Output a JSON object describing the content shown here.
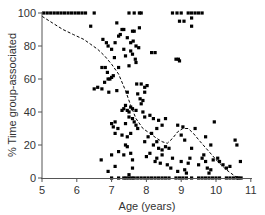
{
  "chart_data": {
    "type": "scatter",
    "title": "",
    "xlabel": "Age (years)",
    "ylabel": "% Time group-associated",
    "xlim": [
      5,
      11
    ],
    "ylim": [
      0,
      100
    ],
    "xticks": [
      5,
      6,
      7,
      8,
      9,
      10,
      11
    ],
    "yticks": [
      0,
      20,
      40,
      60,
      80,
      100
    ],
    "grid": false,
    "legend": null,
    "series": [
      {
        "name": "observations",
        "kind": "points",
        "marker": "square",
        "color": "#000000",
        "points": [
          [
            5.05,
            100
          ],
          [
            5.15,
            100
          ],
          [
            5.25,
            100
          ],
          [
            5.35,
            100
          ],
          [
            5.45,
            100
          ],
          [
            5.55,
            100
          ],
          [
            5.65,
            100
          ],
          [
            5.75,
            100
          ],
          [
            5.85,
            100
          ],
          [
            5.95,
            100
          ],
          [
            6.05,
            100
          ],
          [
            6.15,
            100
          ],
          [
            6.25,
            100
          ],
          [
            6.5,
            100
          ],
          [
            7.5,
            100
          ],
          [
            7.65,
            100
          ],
          [
            7.8,
            100
          ],
          [
            7.85,
            100
          ],
          [
            8.75,
            100
          ],
          [
            8.88,
            100
          ],
          [
            9.0,
            100
          ],
          [
            9.2,
            100
          ],
          [
            9.3,
            100
          ],
          [
            9.4,
            100
          ],
          [
            9.5,
            100
          ],
          [
            9.6,
            100
          ],
          [
            8.95,
            95
          ],
          [
            9.08,
            95
          ],
          [
            9.3,
            97
          ],
          [
            9.3,
            92
          ],
          [
            6.4,
            92
          ],
          [
            7.15,
            94
          ],
          [
            7.3,
            90
          ],
          [
            7.35,
            90
          ],
          [
            7.6,
            89
          ],
          [
            7.8,
            91
          ],
          [
            7.65,
            89
          ],
          [
            6.75,
            84
          ],
          [
            6.85,
            82
          ],
          [
            6.9,
            80
          ],
          [
            7.0,
            78
          ],
          [
            7.1,
            82
          ],
          [
            7.2,
            86
          ],
          [
            7.25,
            87
          ],
          [
            7.45,
            85
          ],
          [
            7.55,
            82
          ],
          [
            7.62,
            83
          ],
          [
            7.7,
            80
          ],
          [
            7.78,
            79
          ],
          [
            7.55,
            77
          ],
          [
            7.35,
            78
          ],
          [
            7.4,
            74
          ],
          [
            7.6,
            75
          ],
          [
            7.68,
            72
          ],
          [
            7.7,
            70
          ],
          [
            7.5,
            68
          ],
          [
            7.2,
            67
          ],
          [
            7.08,
            73
          ],
          [
            8.15,
            76
          ],
          [
            8.25,
            76
          ],
          [
            8.85,
            72
          ],
          [
            8.92,
            72
          ],
          [
            8.95,
            71
          ],
          [
            6.72,
            67
          ],
          [
            6.82,
            67
          ],
          [
            6.88,
            64
          ],
          [
            6.9,
            60
          ],
          [
            6.95,
            60
          ],
          [
            7.0,
            61
          ],
          [
            7.05,
            62
          ],
          [
            6.8,
            58
          ],
          [
            6.5,
            54
          ],
          [
            6.6,
            55
          ],
          [
            6.72,
            54
          ],
          [
            6.92,
            52
          ],
          [
            7.15,
            53
          ],
          [
            7.45,
            52
          ],
          [
            7.75,
            51
          ],
          [
            7.72,
            57
          ],
          [
            7.85,
            57
          ],
          [
            7.95,
            55
          ],
          [
            7.95,
            52
          ],
          [
            8.02,
            56
          ],
          [
            7.9,
            47
          ],
          [
            7.82,
            48
          ],
          [
            7.85,
            45
          ],
          [
            7.3,
            41
          ],
          [
            7.35,
            42
          ],
          [
            7.4,
            44
          ],
          [
            7.45,
            41
          ],
          [
            7.5,
            40
          ],
          [
            7.55,
            43
          ],
          [
            7.6,
            42
          ],
          [
            7.7,
            41
          ],
          [
            7.5,
            37
          ],
          [
            7.6,
            36
          ],
          [
            7.65,
            34
          ],
          [
            7.4,
            33
          ],
          [
            7.7,
            32
          ],
          [
            7.75,
            30
          ],
          [
            7.55,
            27
          ],
          [
            7.45,
            25
          ],
          [
            7.3,
            26
          ],
          [
            7.1,
            27
          ],
          [
            7.05,
            31
          ],
          [
            7.1,
            34
          ],
          [
            7.0,
            33
          ],
          [
            7.18,
            30
          ],
          [
            7.9,
            40
          ],
          [
            7.95,
            37
          ],
          [
            8.1,
            38
          ],
          [
            8.2,
            36
          ],
          [
            8.35,
            35
          ],
          [
            8.45,
            32
          ],
          [
            8.55,
            36
          ],
          [
            8.3,
            30
          ],
          [
            8.15,
            27
          ],
          [
            8.05,
            25
          ],
          [
            7.95,
            22
          ],
          [
            8.2,
            20
          ],
          [
            8.35,
            18
          ],
          [
            8.45,
            17
          ],
          [
            8.55,
            19
          ],
          [
            8.65,
            18
          ],
          [
            8.45,
            14
          ],
          [
            8.3,
            12
          ],
          [
            8.25,
            10
          ],
          [
            8.4,
            9
          ],
          [
            8.6,
            8
          ],
          [
            8.7,
            6
          ],
          [
            8.75,
            12
          ],
          [
            8.0,
            13
          ],
          [
            8.1,
            15
          ],
          [
            8.9,
            32
          ],
          [
            9.05,
            31
          ],
          [
            9.4,
            30
          ],
          [
            9.0,
            26
          ],
          [
            9.1,
            23
          ],
          [
            8.3,
            22
          ],
          [
            9.3,
            18
          ],
          [
            9.95,
            34
          ],
          [
            10.55,
            23
          ],
          [
            10.6,
            20
          ],
          [
            10.7,
            10
          ],
          [
            9.7,
            25
          ],
          [
            9.85,
            20
          ],
          [
            9.92,
            11
          ],
          [
            10.05,
            12
          ],
          [
            10.1,
            10
          ],
          [
            10.2,
            8
          ],
          [
            10.3,
            6
          ],
          [
            10.4,
            7
          ],
          [
            9.2,
            9
          ],
          [
            9.25,
            12
          ],
          [
            9.5,
            8
          ],
          [
            9.6,
            12
          ],
          [
            9.65,
            14
          ],
          [
            9.7,
            10
          ],
          [
            9.75,
            6
          ],
          [
            9.8,
            3
          ],
          [
            9.85,
            5
          ],
          [
            9.0,
            10
          ],
          [
            8.9,
            4
          ],
          [
            9.1,
            5
          ],
          [
            9.15,
            3
          ],
          [
            7.2,
            16
          ],
          [
            7.4,
            20
          ],
          [
            7.45,
            19
          ],
          [
            7.55,
            15
          ],
          [
            7.6,
            11
          ],
          [
            7.35,
            14
          ],
          [
            7.0,
            14
          ],
          [
            6.7,
            11
          ],
          [
            6.9,
            4
          ],
          [
            7.1,
            7
          ],
          [
            7.6,
            6
          ],
          [
            7.5,
            2
          ],
          [
            7.0,
            0
          ],
          [
            7.2,
            0
          ],
          [
            7.35,
            0
          ],
          [
            7.42,
            0
          ],
          [
            7.5,
            0
          ],
          [
            7.58,
            0
          ],
          [
            7.65,
            0
          ],
          [
            7.75,
            0
          ],
          [
            7.85,
            0
          ],
          [
            7.95,
            0
          ],
          [
            8.05,
            0
          ],
          [
            8.15,
            0
          ],
          [
            8.25,
            0
          ],
          [
            8.35,
            0
          ],
          [
            8.45,
            0
          ],
          [
            8.55,
            0
          ],
          [
            8.65,
            0
          ],
          [
            8.85,
            0
          ],
          [
            8.95,
            0
          ],
          [
            9.05,
            0
          ],
          [
            9.15,
            0
          ],
          [
            9.3,
            0
          ],
          [
            9.5,
            0
          ],
          [
            9.6,
            0
          ],
          [
            9.7,
            0
          ],
          [
            9.8,
            0
          ],
          [
            9.9,
            0
          ],
          [
            10.0,
            0
          ],
          [
            10.1,
            0
          ],
          [
            10.3,
            0
          ],
          [
            10.4,
            0
          ],
          [
            10.5,
            0
          ],
          [
            10.6,
            0
          ],
          [
            10.65,
            0
          ],
          [
            10.72,
            0
          ]
        ]
      },
      {
        "name": "smoothed trend",
        "kind": "line",
        "style": "dashed",
        "color": "#000000",
        "points": [
          [
            5.0,
            98
          ],
          [
            5.3,
            94
          ],
          [
            5.6,
            90
          ],
          [
            5.9,
            87
          ],
          [
            6.2,
            84
          ],
          [
            6.4,
            81
          ],
          [
            6.6,
            78
          ],
          [
            6.8,
            74
          ],
          [
            7.0,
            69
          ],
          [
            7.2,
            63
          ],
          [
            7.4,
            53
          ],
          [
            7.55,
            44
          ],
          [
            7.7,
            36
          ],
          [
            7.9,
            30
          ],
          [
            8.1,
            27
          ],
          [
            8.3,
            24
          ],
          [
            8.45,
            22
          ],
          [
            8.6,
            21
          ],
          [
            8.75,
            24
          ],
          [
            8.9,
            28
          ],
          [
            9.05,
            30
          ],
          [
            9.2,
            30
          ],
          [
            9.35,
            27
          ],
          [
            9.55,
            22
          ],
          [
            9.8,
            16
          ],
          [
            10.05,
            10
          ],
          [
            10.3,
            5
          ],
          [
            10.55,
            1
          ],
          [
            10.7,
            0
          ]
        ]
      }
    ]
  },
  "axes": {
    "xlabel": "Age (years)",
    "ylabel": "% Time group-associated",
    "xtick_labels": [
      "5",
      "6",
      "7",
      "8",
      "9",
      "10",
      "11"
    ],
    "ytick_labels": [
      "0",
      "20",
      "40",
      "60",
      "80",
      "100"
    ]
  }
}
